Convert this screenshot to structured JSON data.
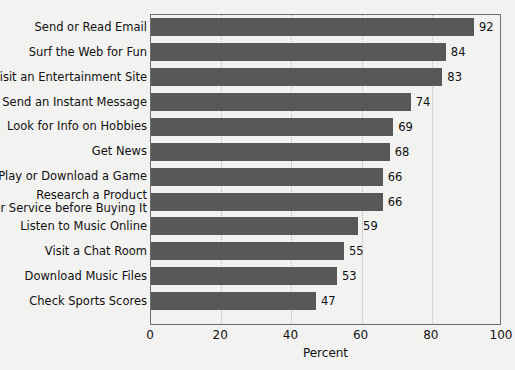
{
  "chart_data": {
    "type": "bar",
    "orientation": "horizontal",
    "title": "",
    "xlabel": "Percent",
    "ylabel": "",
    "xlim": [
      0,
      100
    ],
    "xticks": [
      0,
      20,
      40,
      60,
      80,
      100
    ],
    "xtick_labels": [
      "0",
      "20",
      "40",
      "60",
      "80",
      "100"
    ],
    "grid": "vertical-dotted",
    "legend": "none",
    "bar_color": "#585858",
    "background_color": "#f2f2f0",
    "frame_color": "#6d6d6d",
    "show_value_labels": true,
    "categories": [
      "Send or Read Email",
      "Surf the Web for Fun",
      "Visit an Entertainment Site",
      "Send an Instant Message",
      "Look for Info on Hobbies",
      "Get News",
      "Play or Download a Game",
      "Research a Product or Service before Buying It",
      "Listen to Music Online",
      "Visit a Chat Room",
      "Download Music Files",
      "Check Sports Scores"
    ],
    "category_lines": [
      [
        "Send or Read Email"
      ],
      [
        "Surf the Web for Fun"
      ],
      [
        "Visit an Entertainment Site"
      ],
      [
        "Send an Instant Message"
      ],
      [
        "Look for Info on Hobbies"
      ],
      [
        "Get News"
      ],
      [
        "Play or Download a Game"
      ],
      [
        "Research a Product",
        "or Service before Buying It"
      ],
      [
        "Listen to Music Online"
      ],
      [
        "Visit a Chat Room"
      ],
      [
        "Download Music Files"
      ],
      [
        "Check Sports Scores"
      ]
    ],
    "values": [
      92,
      84,
      83,
      74,
      69,
      68,
      66,
      66,
      59,
      55,
      53,
      47
    ],
    "value_labels": [
      "92",
      "84",
      "83",
      "74",
      "69",
      "68",
      "66",
      "66",
      "59",
      "55",
      "53",
      "47"
    ]
  }
}
